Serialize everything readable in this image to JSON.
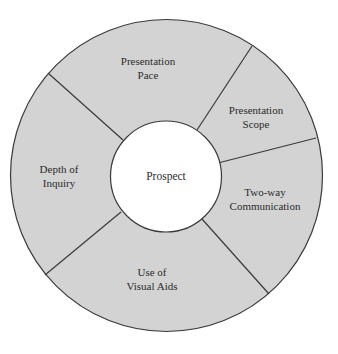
{
  "diagram": {
    "type": "ring",
    "center": {
      "label": "Prospect"
    },
    "segments": [
      {
        "id": "presentation-pace",
        "lines": [
          "Presentation",
          "Pace"
        ]
      },
      {
        "id": "presentation-scope",
        "lines": [
          "Presentation",
          "Scope"
        ]
      },
      {
        "id": "two-way-communication",
        "lines": [
          "Two-way",
          "Communication"
        ]
      },
      {
        "id": "use-of-visual-aids",
        "lines": [
          "Use of",
          "Visual Aids"
        ]
      },
      {
        "id": "depth-of-inquiry",
        "lines": [
          "Depth of",
          "Inquiry"
        ]
      }
    ],
    "colors": {
      "ring_fill": "#d3d3d3",
      "center_fill": "#ffffff",
      "stroke": "#3a3a3a",
      "text": "#2b2b2b"
    }
  }
}
